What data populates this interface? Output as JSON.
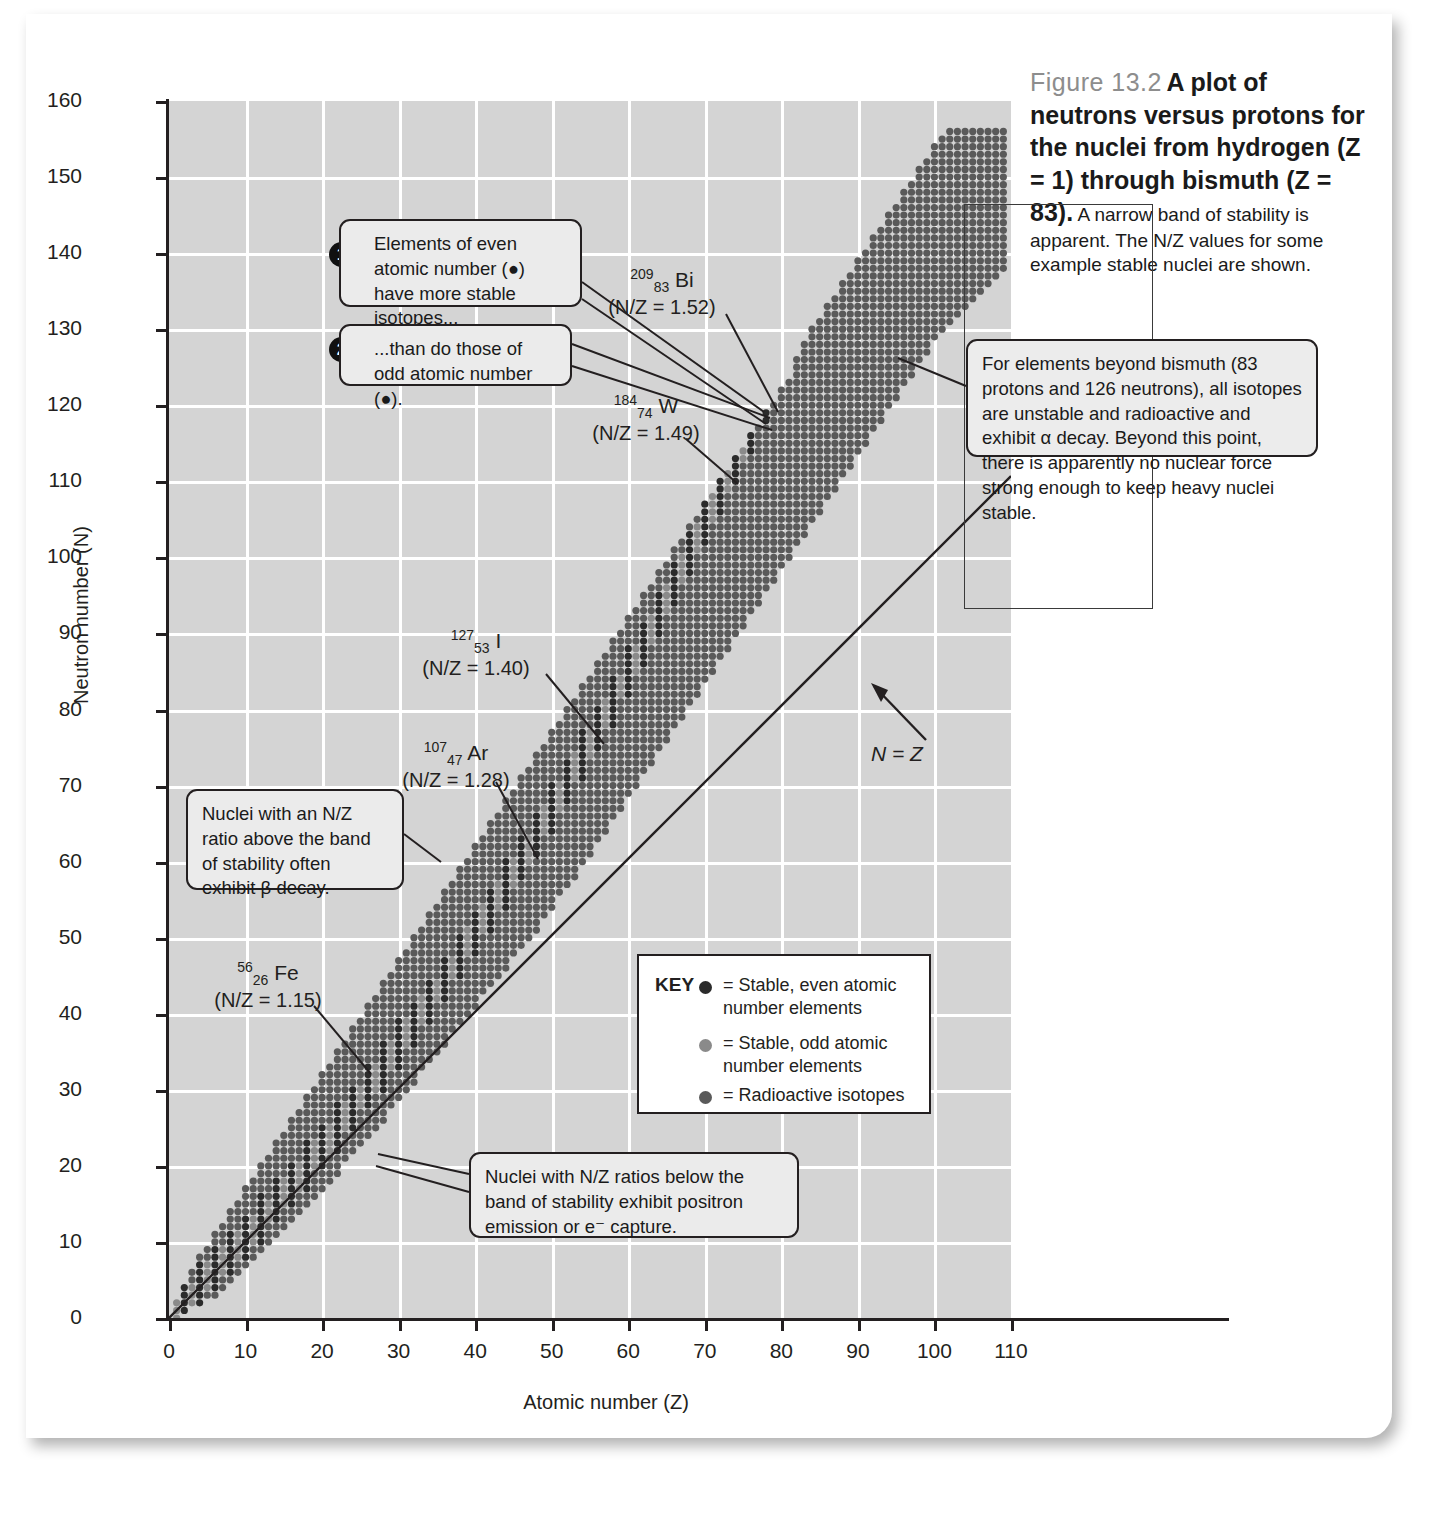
{
  "caption": {
    "figure_number": "Figure 13.2",
    "title_bold": "A plot of neutrons versus protons for the nuclei from hydrogen (Z = 1) through bismuth (Z = 83).",
    "body": "A narrow band of stability is apparent. The N/Z values for some example stable nuclei are shown."
  },
  "axes": {
    "x_title": "Atomic number (Z)",
    "y_title": "Neutron number (N)",
    "x_ticks": [
      0,
      10,
      20,
      30,
      40,
      50,
      60,
      70,
      80,
      90,
      100,
      110
    ],
    "y_ticks": [
      0,
      10,
      20,
      30,
      40,
      50,
      60,
      70,
      80,
      90,
      100,
      110,
      120,
      130,
      140,
      150,
      160
    ]
  },
  "diagonal_label": "N = Z",
  "callouts": {
    "one": {
      "number": "1",
      "text": "Elements of even atomic number (●) have more stable isotopes..."
    },
    "two": {
      "number": "2",
      "text": "...than do those of odd atomic number (●)."
    },
    "beyond_bismuth": "For elements beyond bismuth (83 protons and 126 neutrons), all isotopes are unstable and radioactive and exhibit α decay.  Beyond this point, there is apparently no nuclear force strong enough to keep heavy nuclei stable.",
    "above_band": "Nuclei with an N/Z ratio above the band of stability often exhibit β decay.",
    "below_band": "Nuclei with N/Z ratios below the band of stability exhibit positron emission or e⁻ capture."
  },
  "key": {
    "title": "KEY",
    "entries": [
      {
        "marker_color": "#2b2b2b",
        "text": "= Stable, even atomic number elements"
      },
      {
        "marker_color": "#8a8a8a",
        "text": "= Stable, odd atomic number elements"
      },
      {
        "marker_color": "#5a5a5a",
        "text": "= Radioactive isotopes"
      }
    ]
  },
  "isotope_labels": [
    {
      "id": "bi",
      "mass": "209",
      "atomic": "83",
      "symbol": "Bi",
      "nz": "(N/Z = 1.52)"
    },
    {
      "id": "w",
      "mass": "184",
      "atomic": "74",
      "symbol": "W",
      "nz": "(N/Z = 1.49)"
    },
    {
      "id": "i",
      "mass": "127",
      "atomic": "53",
      "symbol": "I",
      "nz": "(N/Z = 1.40)"
    },
    {
      "id": "ar",
      "mass": "107",
      "atomic": "47",
      "symbol": "Ar",
      "nz": "(N/Z = 1.28)"
    },
    {
      "id": "fe",
      "mass": "56",
      "atomic": "26",
      "symbol": "Fe",
      "nz": "(N/Z = 1.15)"
    }
  ],
  "colors": {
    "plot_background": "#d4d4d4",
    "gridline": "#ffffff",
    "axis": "#231f20",
    "stable_even": "#2b2b2b",
    "stable_odd": "#8a8a8a",
    "radioactive": "#5a5a5a"
  },
  "chart_data": {
    "type": "scatter",
    "title": "A plot of neutrons versus protons for the nuclei from hydrogen (Z = 1) through bismuth (Z = 83)",
    "xlabel": "Atomic number (Z)",
    "ylabel": "Neutron number (N)",
    "xlim": [
      0,
      110
    ],
    "ylim": [
      0,
      160
    ],
    "xtick_step": 10,
    "ytick_step": 10,
    "grid": true,
    "legend_position": "inside-lower-right",
    "series": [
      {
        "name": "Stable, even atomic number elements",
        "color": "#2b2b2b"
      },
      {
        "name": "Stable, odd atomic number elements",
        "color": "#8a8a8a"
      },
      {
        "name": "Radioactive isotopes",
        "color": "#5a5a5a"
      }
    ],
    "annotations": [
      {
        "text": "N = Z",
        "x": 92,
        "y": 62
      },
      {
        "text": "209/83 Bi (N/Z = 1.52)",
        "x": 60,
        "y": 136,
        "points_to": {
          "x": 83,
          "y": 126
        }
      },
      {
        "text": "184/74 W (N/Z = 1.49)",
        "x": 57,
        "y": 120,
        "points_to": {
          "x": 74,
          "y": 110
        }
      },
      {
        "text": "127/53 I (N/Z = 1.40)",
        "x": 34,
        "y": 89,
        "points_to": {
          "x": 53,
          "y": 74
        }
      },
      {
        "text": "107/47 Ar (N/Z = 1.28)",
        "x": 31,
        "y": 74,
        "points_to": {
          "x": 47,
          "y": 60
        }
      },
      {
        "text": "56/26 Fe (N/Z = 1.15)",
        "x": 11,
        "y": 45,
        "points_to": {
          "x": 26,
          "y": 30
        }
      }
    ],
    "band_description": "Each Z column from 1 to 109 spans a contiguous range of neutron numbers N; stable nuclides lie along the valley of stability where N/Z rises from 1.0 at low Z to about 1.5 near Z = 83.",
    "band_columns_note": "N range per Z given as [Nmin, Nmax] in band_columns",
    "band_columns": [
      [
        1,
        0,
        2
      ],
      [
        2,
        1,
        4
      ],
      [
        3,
        2,
        6
      ],
      [
        4,
        2,
        8
      ],
      [
        5,
        3,
        9
      ],
      [
        6,
        3,
        11
      ],
      [
        7,
        4,
        12
      ],
      [
        8,
        5,
        14
      ],
      [
        9,
        6,
        15
      ],
      [
        10,
        7,
        17
      ],
      [
        11,
        8,
        18
      ],
      [
        12,
        9,
        20
      ],
      [
        13,
        10,
        21
      ],
      [
        14,
        11,
        23
      ],
      [
        15,
        12,
        24
      ],
      [
        16,
        13,
        26
      ],
      [
        17,
        14,
        27
      ],
      [
        18,
        15,
        29
      ],
      [
        19,
        16,
        30
      ],
      [
        20,
        17,
        32
      ],
      [
        21,
        18,
        33
      ],
      [
        22,
        19,
        35
      ],
      [
        23,
        21,
        36
      ],
      [
        24,
        22,
        38
      ],
      [
        25,
        23,
        39
      ],
      [
        26,
        24,
        41
      ],
      [
        27,
        25,
        42
      ],
      [
        28,
        26,
        44
      ],
      [
        29,
        28,
        45
      ],
      [
        30,
        29,
        47
      ],
      [
        31,
        30,
        48
      ],
      [
        32,
        31,
        50
      ],
      [
        33,
        33,
        51
      ],
      [
        34,
        34,
        53
      ],
      [
        35,
        35,
        54
      ],
      [
        36,
        36,
        56
      ],
      [
        37,
        38,
        57
      ],
      [
        38,
        39,
        59
      ],
      [
        39,
        40,
        60
      ],
      [
        40,
        41,
        62
      ],
      [
        41,
        43,
        63
      ],
      [
        42,
        44,
        65
      ],
      [
        43,
        45,
        66
      ],
      [
        44,
        46,
        68
      ],
      [
        45,
        48,
        69
      ],
      [
        46,
        49,
        71
      ],
      [
        47,
        50,
        72
      ],
      [
        48,
        51,
        74
      ],
      [
        49,
        53,
        75
      ],
      [
        50,
        54,
        77
      ],
      [
        51,
        56,
        78
      ],
      [
        52,
        57,
        80
      ],
      [
        53,
        58,
        81
      ],
      [
        54,
        60,
        83
      ],
      [
        55,
        61,
        84
      ],
      [
        56,
        63,
        86
      ],
      [
        57,
        64,
        87
      ],
      [
        58,
        66,
        89
      ],
      [
        59,
        67,
        90
      ],
      [
        60,
        69,
        92
      ],
      [
        61,
        70,
        93
      ],
      [
        62,
        72,
        95
      ],
      [
        63,
        73,
        96
      ],
      [
        64,
        75,
        98
      ],
      [
        65,
        76,
        99
      ],
      [
        66,
        78,
        101
      ],
      [
        67,
        79,
        102
      ],
      [
        68,
        81,
        104
      ],
      [
        69,
        82,
        105
      ],
      [
        70,
        84,
        107
      ],
      [
        71,
        85,
        108
      ],
      [
        72,
        87,
        110
      ],
      [
        73,
        88,
        111
      ],
      [
        74,
        90,
        113
      ],
      [
        75,
        91,
        114
      ],
      [
        76,
        93,
        116
      ],
      [
        77,
        94,
        117
      ],
      [
        78,
        96,
        119
      ],
      [
        79,
        97,
        120
      ],
      [
        80,
        99,
        122
      ],
      [
        81,
        100,
        123
      ],
      [
        82,
        102,
        126
      ],
      [
        83,
        103,
        128
      ],
      [
        84,
        105,
        130
      ],
      [
        85,
        106,
        131
      ],
      [
        86,
        108,
        133
      ],
      [
        87,
        109,
        134
      ],
      [
        88,
        111,
        136
      ],
      [
        89,
        112,
        137
      ],
      [
        90,
        114,
        139
      ],
      [
        91,
        115,
        140
      ],
      [
        92,
        117,
        142
      ],
      [
        93,
        118,
        143
      ],
      [
        94,
        120,
        145
      ],
      [
        95,
        121,
        146
      ],
      [
        96,
        123,
        148
      ],
      [
        97,
        124,
        149
      ],
      [
        98,
        126,
        151
      ],
      [
        99,
        127,
        152
      ],
      [
        100,
        129,
        154
      ],
      [
        101,
        130,
        155
      ],
      [
        102,
        131,
        156
      ],
      [
        103,
        132,
        156
      ],
      [
        104,
        133,
        156
      ],
      [
        105,
        134,
        156
      ],
      [
        106,
        135,
        156
      ],
      [
        107,
        136,
        156
      ],
      [
        108,
        137,
        156
      ],
      [
        109,
        138,
        156
      ]
    ]
  }
}
